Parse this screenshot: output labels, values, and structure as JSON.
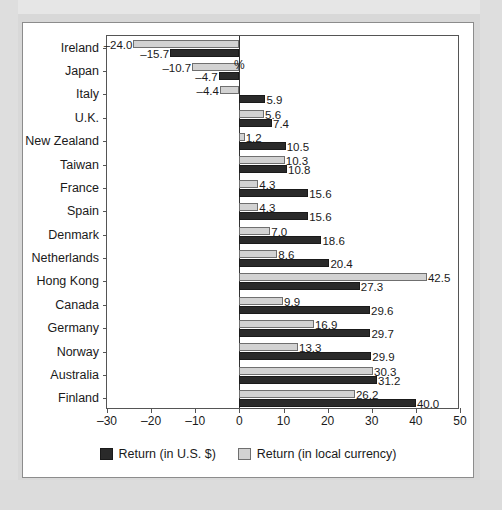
{
  "chart_data": {
    "type": "bar",
    "orientation": "horizontal",
    "title": "",
    "xlabel": "%",
    "ylabel": "",
    "xlim": [
      -30,
      50
    ],
    "xticks": [
      -30,
      -20,
      -10,
      0,
      10,
      20,
      30,
      40,
      50
    ],
    "xtick_labels": [
      "–30",
      "–20",
      "–10",
      "0",
      "10",
      "20",
      "30",
      "40",
      "50"
    ],
    "grid": false,
    "legend_position": "bottom-center",
    "categories": [
      "Ireland",
      "Japan",
      "Italy",
      "U.K.",
      "New Zealand",
      "Taiwan",
      "France",
      "Spain",
      "Denmark",
      "Netherlands",
      "Hong Kong",
      "Canada",
      "Germany",
      "Norway",
      "Australia",
      "Finland"
    ],
    "series": [
      {
        "name": "Return (in local currency)",
        "color": "#d2d2d2",
        "values": [
          -24.0,
          -10.7,
          -4.4,
          5.6,
          1.2,
          10.3,
          4.3,
          4.3,
          7.0,
          8.6,
          42.5,
          9.9,
          16.9,
          13.3,
          30.3,
          26.2
        ],
        "labels": [
          "–24.0",
          "–10.7",
          "–4.4",
          "5.6",
          "1.2",
          "10.3",
          "4.3",
          "4.3",
          "7.0",
          "8.6",
          "42.5",
          "9.9",
          "16.9",
          "13.3",
          "30.3",
          "26.2"
        ]
      },
      {
        "name": "Return (in U.S. $)",
        "color": "#2a2a2a",
        "values": [
          -15.7,
          -4.7,
          5.9,
          7.4,
          10.5,
          10.8,
          15.6,
          15.6,
          18.6,
          20.4,
          27.3,
          29.6,
          29.7,
          29.9,
          31.2,
          40.0
        ],
        "labels": [
          "–15.7",
          "–4.7",
          "5.9",
          "7.4",
          "10.5",
          "10.8",
          "15.6",
          "15.6",
          "18.6",
          "20.4",
          "27.3",
          "29.6",
          "29.7",
          "29.9",
          "31.2",
          "40.0"
        ]
      }
    ],
    "legend": [
      {
        "label": "Return (in U.S. $)",
        "swatch": "dark"
      },
      {
        "label": "Return (in local currency)",
        "swatch": "light"
      }
    ]
  }
}
